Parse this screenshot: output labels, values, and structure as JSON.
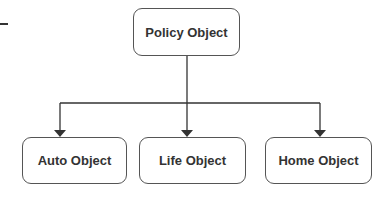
{
  "diagram": {
    "root": {
      "label": "Policy Object"
    },
    "children": [
      {
        "label": "Auto Object"
      },
      {
        "label": "Life Object"
      },
      {
        "label": "Home Object"
      }
    ],
    "colors": {
      "stroke": "#333333",
      "text": "#333333",
      "background": "#ffffff"
    }
  }
}
